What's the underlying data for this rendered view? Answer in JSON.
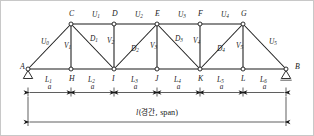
{
  "figure": {
    "type": "truss-diagram",
    "colors": {
      "line": "#1a1a1a",
      "background": "#ffffff",
      "border": "#c8c8c8"
    }
  },
  "geometry": {
    "top_chord_y": 23,
    "bottom_chord_y": 68,
    "panel_count": 6,
    "bottom_nodes_x": [
      27,
      70,
      113,
      156,
      199,
      242,
      285
    ],
    "top_nodes_x": [
      70,
      113,
      156,
      199,
      242
    ]
  },
  "nodes": {
    "bottom": [
      {
        "id": "A",
        "label": "A",
        "x": 27,
        "label_x": 19,
        "label_y": 66,
        "support": "pin"
      },
      {
        "id": "H",
        "label": "H",
        "x": 70,
        "label_x": 68,
        "label_y": 78,
        "support": "none"
      },
      {
        "id": "I",
        "label": "I",
        "x": 113,
        "label_x": 111,
        "label_y": 78,
        "support": "none"
      },
      {
        "id": "J",
        "label": "J",
        "x": 156,
        "label_x": 154,
        "label_y": 78,
        "support": "none"
      },
      {
        "id": "K",
        "label": "K",
        "x": 199,
        "label_x": 197,
        "label_y": 78,
        "support": "none"
      },
      {
        "id": "L",
        "label": "L",
        "x": 242,
        "label_x": 240,
        "label_y": 78,
        "support": "none"
      },
      {
        "id": "B",
        "label": "B",
        "x": 285,
        "label_x": 294,
        "label_y": 66,
        "support": "roller"
      }
    ],
    "top": [
      {
        "id": "C",
        "label": "C",
        "x": 70,
        "label_x": 68,
        "label_y": 13
      },
      {
        "id": "D",
        "label": "D",
        "x": 113,
        "label_x": 111,
        "label_y": 13
      },
      {
        "id": "E",
        "label": "E",
        "x": 156,
        "label_x": 154,
        "label_y": 13
      },
      {
        "id": "F",
        "label": "F",
        "x": 199,
        "label_x": 197,
        "label_y": 13
      },
      {
        "id": "G",
        "label": "G",
        "x": 242,
        "label_x": 240,
        "label_y": 13
      }
    ]
  },
  "members": {
    "top_chord": [
      {
        "id": "U1",
        "base": "U",
        "sub": "1",
        "from": "C",
        "to": "D",
        "label_x": 91,
        "label_y": 14
      },
      {
        "id": "U2",
        "base": "U",
        "sub": "2",
        "from": "D",
        "to": "E",
        "label_x": 134,
        "label_y": 14
      },
      {
        "id": "U3",
        "base": "U",
        "sub": "3",
        "from": "E",
        "to": "F",
        "label_x": 177,
        "label_y": 14
      },
      {
        "id": "U4",
        "base": "U",
        "sub": "4",
        "from": "F",
        "to": "G",
        "label_x": 220,
        "label_y": 14
      }
    ],
    "end_posts": [
      {
        "id": "U0",
        "base": "U",
        "sub": "0",
        "from": "A",
        "to": "C",
        "label_x": 40,
        "label_y": 41
      },
      {
        "id": "U5",
        "base": "U",
        "sub": "5",
        "from": "G",
        "to": "B",
        "label_x": 268,
        "label_y": 41
      }
    ],
    "bottom_chord": [
      {
        "id": "L1",
        "base": "L",
        "sub": "1",
        "from": "A",
        "to": "H",
        "label_x": 46,
        "label_y": 78
      },
      {
        "id": "L2",
        "base": "L",
        "sub": "2",
        "from": "H",
        "to": "I",
        "label_x": 89,
        "label_y": 78
      },
      {
        "id": "L3",
        "base": "L",
        "sub": "3",
        "from": "I",
        "to": "J",
        "label_x": 132,
        "label_y": 78
      },
      {
        "id": "L4",
        "base": "L",
        "sub": "4",
        "from": "J",
        "to": "K",
        "label_x": 175,
        "label_y": 78
      },
      {
        "id": "L5",
        "base": "L",
        "sub": "5",
        "from": "K",
        "to": "L",
        "label_x": 218,
        "label_y": 78
      },
      {
        "id": "L6",
        "base": "L",
        "sub": "6",
        "from": "L",
        "to": "B",
        "label_x": 261,
        "label_y": 78
      }
    ],
    "verticals": [
      {
        "id": "V1",
        "base": "V",
        "sub": "1",
        "from": "C",
        "to": "H",
        "label_x": 63,
        "label_y": 45
      },
      {
        "id": "V2",
        "base": "V",
        "sub": "2",
        "from": "D",
        "to": "I",
        "label_x": 106,
        "label_y": 40
      },
      {
        "id": "V3",
        "base": "V",
        "sub": "3",
        "from": "E",
        "to": "J",
        "label_x": 149,
        "label_y": 45
      },
      {
        "id": "V4",
        "base": "V",
        "sub": "4",
        "from": "F",
        "to": "K",
        "label_x": 192,
        "label_y": 40
      },
      {
        "id": "V5",
        "base": "V",
        "sub": "5",
        "from": "G",
        "to": "L",
        "label_x": 235,
        "label_y": 45
      }
    ],
    "diagonals": [
      {
        "id": "D1",
        "base": "D",
        "sub": "1",
        "from": "C",
        "to": "I",
        "label_x": 89,
        "label_y": 38
      },
      {
        "id": "D2",
        "base": "D",
        "sub": "2",
        "from": "E",
        "to": "I",
        "label_x": 130,
        "label_y": 48
      },
      {
        "id": "D3",
        "base": "D",
        "sub": "3",
        "from": "E",
        "to": "K",
        "label_x": 174,
        "label_y": 38
      },
      {
        "id": "D4",
        "base": "D",
        "sub": "4",
        "from": "G",
        "to": "K",
        "label_x": 216,
        "label_y": 48
      }
    ]
  },
  "dimensions": {
    "panel_label": "a",
    "panel_dim_y": 91,
    "panels": [
      {
        "label": "a",
        "x1": 27,
        "x2": 70,
        "label_x": 48.5,
        "label_y": 86
      },
      {
        "label": "a",
        "x1": 70,
        "x2": 113,
        "label_x": 91.5,
        "label_y": 86
      },
      {
        "label": "a",
        "x1": 113,
        "x2": 156,
        "label_x": 134.5,
        "label_y": 86
      },
      {
        "label": "a",
        "x1": 156,
        "x2": 199,
        "label_x": 177.5,
        "label_y": 86
      },
      {
        "label": "a",
        "x1": 199,
        "x2": 242,
        "label_x": 220.5,
        "label_y": 86
      },
      {
        "label": "a",
        "x1": 242,
        "x2": 285,
        "label_x": 263.5,
        "label_y": 86
      }
    ],
    "span": {
      "symbol": "l",
      "korean": "(경간, ",
      "english": "span)",
      "full_label": "l(경간, span)",
      "x1": 27,
      "x2": 285,
      "line_y": 121,
      "label_x": 156,
      "label_y": 112
    }
  }
}
